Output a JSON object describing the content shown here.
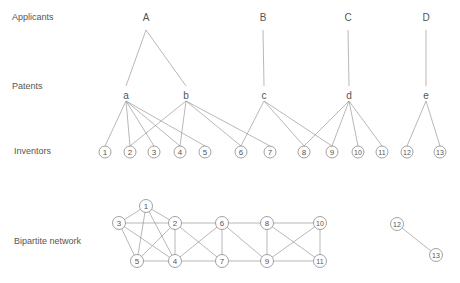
{
  "row_labels": {
    "applicants": "Applicants",
    "patents": "Patents",
    "inventors": "Inventors",
    "bipartite": "Bipartite network"
  },
  "applicants": [
    {
      "id": "A",
      "x": 146,
      "y": 17
    },
    {
      "id": "B",
      "x": 263,
      "y": 17
    },
    {
      "id": "C",
      "x": 348,
      "y": 17
    },
    {
      "id": "D",
      "x": 426,
      "y": 17
    }
  ],
  "patents": [
    {
      "id": "a",
      "x": 126,
      "y": 96,
      "applicant": "A"
    },
    {
      "id": "b",
      "x": 186,
      "y": 96,
      "applicant": "A"
    },
    {
      "id": "c",
      "x": 264,
      "y": 96,
      "applicant": "B"
    },
    {
      "id": "d",
      "x": 349,
      "y": 96,
      "applicant": "C"
    },
    {
      "id": "e",
      "x": 426,
      "y": 96,
      "applicant": "D"
    }
  ],
  "inventors": [
    {
      "id": "1",
      "x": 105,
      "y": 152
    },
    {
      "id": "2",
      "x": 130,
      "y": 152
    },
    {
      "id": "3",
      "x": 154,
      "y": 152
    },
    {
      "id": "4",
      "x": 180,
      "y": 152
    },
    {
      "id": "5",
      "x": 205,
      "y": 152
    },
    {
      "id": "6",
      "x": 241,
      "y": 152
    },
    {
      "id": "7",
      "x": 270,
      "y": 152
    },
    {
      "id": "8",
      "x": 304,
      "y": 152
    },
    {
      "id": "9",
      "x": 332,
      "y": 152
    },
    {
      "id": "10",
      "x": 358,
      "y": 152
    },
    {
      "id": "11",
      "x": 382,
      "y": 152
    },
    {
      "id": "12",
      "x": 407,
      "y": 152
    },
    {
      "id": "13",
      "x": 440,
      "y": 152
    }
  ],
  "patent_inventor_edges": {
    "a": [
      "1",
      "2",
      "3",
      "4",
      "5"
    ],
    "b": [
      "2",
      "4",
      "6",
      "7"
    ],
    "c": [
      "6",
      "8",
      "9"
    ],
    "d": [
      "8",
      "9",
      "10",
      "11"
    ],
    "e": [
      "12",
      "13"
    ]
  },
  "bipartite_nodes": [
    {
      "id": "1",
      "x": 146,
      "y": 206
    },
    {
      "id": "2",
      "x": 175,
      "y": 223
    },
    {
      "id": "3",
      "x": 119,
      "y": 223
    },
    {
      "id": "4",
      "x": 175,
      "y": 261
    },
    {
      "id": "5",
      "x": 137,
      "y": 261
    },
    {
      "id": "6",
      "x": 222,
      "y": 223
    },
    {
      "id": "7",
      "x": 222,
      "y": 261
    },
    {
      "id": "8",
      "x": 267,
      "y": 223
    },
    {
      "id": "9",
      "x": 267,
      "y": 261
    },
    {
      "id": "10",
      "x": 320,
      "y": 223
    },
    {
      "id": "11",
      "x": 320,
      "y": 261
    },
    {
      "id": "12",
      "x": 397,
      "y": 224
    },
    {
      "id": "13",
      "x": 436,
      "y": 255
    }
  ],
  "bipartite_edges": [
    [
      "1",
      "3"
    ],
    [
      "1",
      "2"
    ],
    [
      "1",
      "5"
    ],
    [
      "1",
      "4"
    ],
    [
      "3",
      "2"
    ],
    [
      "3",
      "5"
    ],
    [
      "3",
      "4"
    ],
    [
      "2",
      "5"
    ],
    [
      "2",
      "4"
    ],
    [
      "5",
      "4"
    ],
    [
      "2",
      "6"
    ],
    [
      "2",
      "7"
    ],
    [
      "4",
      "6"
    ],
    [
      "4",
      "7"
    ],
    [
      "6",
      "7"
    ],
    [
      "6",
      "8"
    ],
    [
      "6",
      "9"
    ],
    [
      "7",
      "9"
    ],
    [
      "8",
      "9"
    ],
    [
      "8",
      "10"
    ],
    [
      "8",
      "11"
    ],
    [
      "9",
      "10"
    ],
    [
      "9",
      "11"
    ],
    [
      "10",
      "11"
    ],
    [
      "12",
      "13"
    ]
  ],
  "colors": {
    "line": "#9a9a9a",
    "text": "#555555",
    "node_stroke": "#8a8a8a"
  }
}
